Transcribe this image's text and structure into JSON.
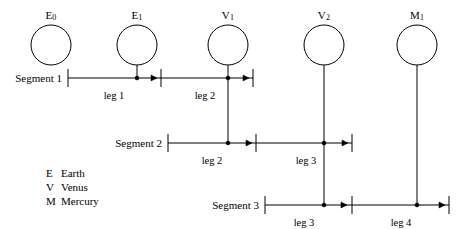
{
  "diagram": {
    "stroke_color": "#000000",
    "background_color": "#ffffff",
    "nodes": [
      {
        "id": "E0",
        "label_letter": "E",
        "label_sub": "0",
        "cx": 51,
        "cy": 45,
        "r": 20,
        "stem_to": null
      },
      {
        "id": "E1",
        "label_letter": "E",
        "label_sub": "1",
        "cx": 137,
        "cy": 45,
        "r": 20,
        "stem_to": 78
      },
      {
        "id": "V1",
        "label_letter": "V",
        "label_sub": "1",
        "cx": 228,
        "cy": 45,
        "r": 20,
        "stem_to": 143
      },
      {
        "id": "V2",
        "label_letter": "V",
        "label_sub": "2",
        "cx": 324,
        "cy": 45,
        "r": 20,
        "stem_to": 205
      },
      {
        "id": "M1",
        "label_letter": "M",
        "label_sub": "1",
        "cx": 417,
        "cy": 45,
        "r": 20,
        "stem_to": 205
      }
    ],
    "segments": [
      {
        "id": "segment-1",
        "label": "Segment 1",
        "label_x": 66,
        "y": 78,
        "start_x": 68,
        "end_x": 253,
        "ticks": [
          68,
          161,
          253
        ],
        "dots": [
          137,
          228
        ],
        "arrows": [
          157,
          249
        ],
        "legs": [
          {
            "label": "leg 1",
            "center_x": 114,
            "label_y": 90
          },
          {
            "label": "leg 2",
            "center_x": 205,
            "label_y": 90
          }
        ]
      },
      {
        "id": "segment-2",
        "label": "Segment 2",
        "label_x": 166,
        "y": 143,
        "start_x": 168,
        "end_x": 352,
        "ticks": [
          168,
          256,
          352
        ],
        "dots": [
          228,
          324
        ],
        "arrows": [
          252,
          348
        ],
        "legs": [
          {
            "label": "leg 2",
            "center_x": 212,
            "label_y": 155
          },
          {
            "label": "leg 3",
            "center_x": 306,
            "label_y": 155
          }
        ]
      },
      {
        "id": "segment-3",
        "label": "Segment 3",
        "label_x": 263,
        "y": 205,
        "start_x": 265,
        "end_x": 449,
        "ticks": [
          265,
          352,
          449
        ],
        "dots": [
          324,
          417
        ],
        "arrows": [
          347,
          445
        ],
        "legs": [
          {
            "label": "leg 3",
            "center_x": 304,
            "label_y": 217
          },
          {
            "label": "leg 4",
            "center_x": 401,
            "label_y": 217
          }
        ]
      }
    ],
    "legend": {
      "items": [
        {
          "key": "E",
          "name": "Earth"
        },
        {
          "key": "V",
          "name": "Venus"
        },
        {
          "key": "M",
          "name": "Mercury"
        }
      ]
    }
  }
}
